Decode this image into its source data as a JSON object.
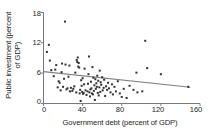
{
  "chart_data": {
    "type": "scatter",
    "title": "",
    "xlabel": "Government debt (percent of GDP)",
    "ylabel": "Public investment (percent of GDP)",
    "ylabel_line1": "Public investment (percent",
    "ylabel_line2": "of GDP)",
    "xlim": [
      0,
      160
    ],
    "ylim": [
      0,
      18
    ],
    "xticks": [
      0,
      40,
      80,
      120,
      160
    ],
    "yticks": [
      0,
      6,
      12,
      18
    ],
    "xtick_labels": [
      "0",
      "40",
      "80",
      "120",
      "160"
    ],
    "ytick_labels": [
      "0",
      "6",
      "12",
      "18"
    ],
    "grid": false,
    "legend": null,
    "marker_color": "#333333",
    "marker_size_px": 2.0,
    "trendline": {
      "label": "linear fit",
      "color": "#808080",
      "x": [
        0,
        150
      ],
      "y": [
        6.3,
        3.2
      ]
    },
    "points": [
      [
        3.5,
        10.2
      ],
      [
        5.5,
        11.6
      ],
      [
        6.5,
        8.5
      ],
      [
        8.0,
        6.6
      ],
      [
        10.5,
        5.4
      ],
      [
        12.0,
        6.7
      ],
      [
        13.0,
        7.6
      ],
      [
        14.5,
        3.2
      ],
      [
        15.5,
        4.4
      ],
      [
        16.5,
        4.1
      ],
      [
        17.5,
        2.6
      ],
      [
        18.5,
        6.2
      ],
      [
        19.0,
        7.9
      ],
      [
        20.0,
        3.3
      ],
      [
        21.0,
        4.9
      ],
      [
        22.0,
        16.2
      ],
      [
        22.5,
        7.7
      ],
      [
        23.5,
        2.8
      ],
      [
        24.5,
        3.0
      ],
      [
        25.5,
        5.3
      ],
      [
        26.5,
        7.5
      ],
      [
        27.0,
        2.4
      ],
      [
        28.0,
        3.1
      ],
      [
        29.5,
        2.5
      ],
      [
        30.5,
        2.9
      ],
      [
        31.5,
        3.4
      ],
      [
        32.5,
        6.1
      ],
      [
        33.5,
        2.2
      ],
      [
        34.0,
        8.6
      ],
      [
        34.5,
        8.2
      ],
      [
        35.0,
        9.1
      ],
      [
        35.5,
        7.3
      ],
      [
        36.0,
        8.0
      ],
      [
        36.5,
        7.1
      ],
      [
        37.0,
        2.0
      ],
      [
        37.5,
        2.7
      ],
      [
        38.0,
        0.5
      ],
      [
        38.5,
        4.6
      ],
      [
        39.0,
        3.5
      ],
      [
        39.5,
        2.3
      ],
      [
        40.0,
        5.0
      ],
      [
        40.5,
        1.9
      ],
      [
        41.0,
        2.1
      ],
      [
        41.5,
        3.8
      ],
      [
        42.0,
        6.9
      ],
      [
        43.0,
        2.6
      ],
      [
        44.0,
        1.7
      ],
      [
        45.0,
        2.4
      ],
      [
        45.5,
        3.9
      ],
      [
        46.0,
        5.8
      ],
      [
        46.5,
        9.3
      ],
      [
        47.0,
        2.2
      ],
      [
        47.5,
        1.4
      ],
      [
        48.0,
        2.8
      ],
      [
        48.5,
        4.3
      ],
      [
        49.0,
        3.0
      ],
      [
        49.5,
        2.0
      ],
      [
        50.0,
        7.2
      ],
      [
        50.5,
        1.8
      ],
      [
        51.0,
        5.1
      ],
      [
        51.5,
        2.5
      ],
      [
        52.0,
        3.6
      ],
      [
        52.5,
        0.7
      ],
      [
        53.0,
        4.8
      ],
      [
        53.5,
        2.9
      ],
      [
        54.0,
        4.0
      ],
      [
        54.5,
        3.3
      ],
      [
        55.0,
        5.5
      ],
      [
        55.5,
        2.1
      ],
      [
        56.0,
        4.5
      ],
      [
        56.5,
        1.6
      ],
      [
        57.0,
        3.2
      ],
      [
        57.5,
        6.5
      ],
      [
        58.0,
        2.3
      ],
      [
        58.5,
        4.2
      ],
      [
        59.0,
        3.7
      ],
      [
        60.0,
        5.2
      ],
      [
        60.5,
        2.6
      ],
      [
        61.5,
        3.1
      ],
      [
        62.0,
        4.7
      ],
      [
        63.0,
        1.5
      ],
      [
        64.0,
        3.4
      ],
      [
        65.0,
        2.7
      ],
      [
        66.0,
        4.1
      ],
      [
        67.0,
        3.0
      ],
      [
        68.5,
        2.2
      ],
      [
        70.0,
        3.8
      ],
      [
        71.0,
        1.8
      ],
      [
        72.5,
        3.3
      ],
      [
        74.0,
        2.4
      ],
      [
        76.0,
        4.4
      ],
      [
        78.0,
        2.0
      ],
      [
        80.0,
        1.3
      ],
      [
        82.0,
        2.9
      ],
      [
        85.0,
        1.1
      ],
      [
        88.0,
        3.5
      ],
      [
        92.0,
        2.7
      ],
      [
        95.0,
        6.1
      ],
      [
        96.0,
        2.2
      ],
      [
        101.0,
        2.4
      ],
      [
        104.0,
        12.4
      ],
      [
        106.0,
        7.0
      ],
      [
        120.0,
        5.8
      ],
      [
        148.0,
        3.3
      ]
    ]
  }
}
